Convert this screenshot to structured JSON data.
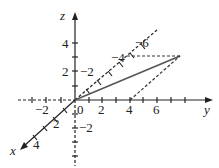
{
  "diagram": {
    "type": "3d-coordinate-axes",
    "axes": {
      "x": "x",
      "y": "y",
      "z": "z"
    },
    "origin_label": "0",
    "z_ticks": [
      "4",
      "2",
      "−2"
    ],
    "y_ticks": [
      "−2",
      "2",
      "4",
      "6"
    ],
    "x_ticks": [
      "2",
      "4"
    ],
    "x_neg_ticks": [
      "−2",
      "−4",
      "−6"
    ],
    "colors": {
      "ink": "#222222",
      "vector": "#555555"
    }
  }
}
